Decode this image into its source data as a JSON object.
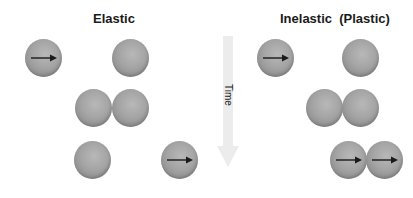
{
  "titles": {
    "elastic": "Elastic",
    "inelastic": "Inelastic  (Plastic)"
  },
  "time_axis": {
    "label": "Time",
    "direction": "down"
  },
  "colors": {
    "ball": "#a0a0a0",
    "arrow": "#1a1a1a",
    "time_arrow": "#e8e8e8",
    "title": "#1a1a1a"
  },
  "panels": [
    {
      "name": "elastic",
      "rows": [
        {
          "stage": "before",
          "balls": [
            {
              "x": 25,
              "y": 39,
              "moving": true
            },
            {
              "x": 112,
              "y": 39,
              "moving": false
            }
          ]
        },
        {
          "stage": "collision",
          "balls": [
            {
              "x": 75,
              "y": 89,
              "moving": false
            },
            {
              "x": 112,
              "y": 89,
              "moving": false
            }
          ]
        },
        {
          "stage": "after",
          "balls": [
            {
              "x": 74,
              "y": 141,
              "moving": false
            },
            {
              "x": 161,
              "y": 141,
              "moving": true
            }
          ]
        }
      ]
    },
    {
      "name": "inelastic",
      "rows": [
        {
          "stage": "before",
          "balls": [
            {
              "x": 257,
              "y": 39,
              "moving": true
            },
            {
              "x": 342,
              "y": 39,
              "moving": false
            }
          ]
        },
        {
          "stage": "collision",
          "balls": [
            {
              "x": 306,
              "y": 89,
              "moving": false
            },
            {
              "x": 342,
              "y": 89,
              "moving": false
            }
          ]
        },
        {
          "stage": "after",
          "balls": [
            {
              "x": 330,
              "y": 141,
              "moving": true
            },
            {
              "x": 366,
              "y": 141,
              "moving": true
            }
          ]
        }
      ]
    }
  ]
}
